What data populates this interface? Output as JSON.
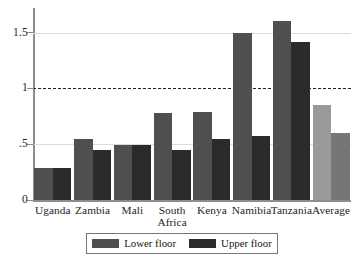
{
  "chart_data": {
    "type": "bar",
    "title": "",
    "subtitle": "",
    "xlabel": "",
    "ylabel": "",
    "categories": [
      "Uganda",
      "Zambia",
      "Mali",
      "South Africa",
      "Kenya",
      "Namibia",
      "Tanzania",
      "Average"
    ],
    "category_lines": [
      [
        "Uganda"
      ],
      [
        "Zambia"
      ],
      [
        "Mali"
      ],
      [
        "South",
        "Africa"
      ],
      [
        "Kenya"
      ],
      [
        "Namibia"
      ],
      [
        "Tanzania"
      ],
      [
        "Average"
      ]
    ],
    "series": [
      {
        "name": "Lower floor",
        "color": "#4f4f4f",
        "values": [
          0.29,
          0.55,
          0.49,
          0.78,
          0.79,
          1.5,
          1.6,
          0.85
        ]
      },
      {
        "name": "Upper floor",
        "color": "#2b2b2b",
        "values": [
          0.29,
          0.45,
          0.49,
          0.45,
          0.55,
          0.57,
          1.42,
          0.6
        ]
      }
    ],
    "highlight_category": "Average",
    "highlight_colors": {
      "lower": "#9a9a9a",
      "upper": "#767676"
    },
    "ylim": [
      0,
      1.72
    ],
    "yticks": [
      0,
      0.5,
      1,
      1.5
    ],
    "ytick_labels": [
      "0",
      ".5",
      "1",
      "1.5"
    ],
    "gridlines": [
      0.5,
      1.5
    ],
    "reference_line": {
      "value": 1,
      "style": "dashed",
      "color": "#242424"
    },
    "grid": true,
    "legend_position": "bottom"
  },
  "legend": {
    "entries": [
      {
        "label": "Lower floor",
        "color": "#4f4f4f"
      },
      {
        "label": "Upper floor",
        "color": "#2b2b2b"
      }
    ]
  },
  "axis": {
    "y_tick_labels": [
      "1.5",
      "1",
      ".5",
      "0"
    ]
  }
}
